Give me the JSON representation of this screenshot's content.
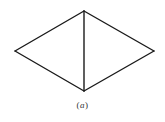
{
  "diagram": {
    "type": "rhombus-split",
    "stroke_color": "#1a1a1a",
    "stroke_width": 1.4,
    "vertices": {
      "top": [
        84,
        11
      ],
      "right": [
        154,
        51
      ],
      "bottom": [
        84,
        91
      ],
      "left": [
        15,
        51
      ]
    },
    "edges": [
      [
        "top",
        "right"
      ],
      [
        "right",
        "bottom"
      ],
      [
        "bottom",
        "left"
      ],
      [
        "left",
        "top"
      ],
      [
        "top",
        "bottom"
      ]
    ]
  },
  "caption": {
    "open": "(",
    "letter": "a",
    "close": ")"
  }
}
